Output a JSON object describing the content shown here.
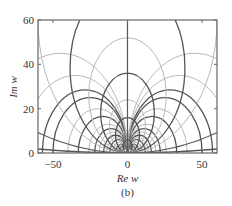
{
  "figure": {
    "panel_label": "(b)"
  },
  "chart_data": {
    "type": "line",
    "subtype": "contour",
    "title": "",
    "panel_label": "(b)",
    "xlabel": "Re w",
    "ylabel": "Im w",
    "xlim": [
      -60,
      60
    ],
    "ylim": [
      0,
      60
    ],
    "xticks": [
      -50,
      0,
      50
    ],
    "xtick_labels": [
      "−50",
      "0",
      "50"
    ],
    "yticks": [
      0,
      20,
      40,
      60
    ],
    "ytick_labels": [
      "0",
      "20",
      "40",
      "60"
    ],
    "grid": false,
    "legend": null,
    "series": [
      {
        "name": "family A (circles centered on Re axis, tangent to Im axis at origin)",
        "center_axis": "real",
        "radii": [
          2,
          2.5,
          3,
          3.5,
          4,
          5,
          6,
          7,
          8,
          9.5,
          11,
          13,
          16.5,
          20,
          25,
          28.5,
          35,
          45
        ],
        "shades": [
          "dark",
          "light",
          "dark",
          "light",
          "dark",
          "light",
          "dark",
          "light",
          "dark",
          "light",
          "dark",
          "light",
          "dark",
          "light",
          "dark",
          "dark",
          "light",
          "light"
        ]
      },
      {
        "name": "family B (circles centered on Im axis, tangent to Re axis at origin)",
        "center_axis": "imag",
        "radii": [
          3,
          5,
          8,
          12,
          18,
          26,
          38.5,
          60,
          200,
          1000
        ],
        "shades": [
          "dark",
          "light",
          "dark",
          "light",
          "dark",
          "light",
          "dark",
          "light",
          "dark",
          "dark"
        ]
      }
    ],
    "colors": {
      "dark": "#555555",
      "light": "#b8b8b8",
      "frame": "#666666"
    }
  }
}
